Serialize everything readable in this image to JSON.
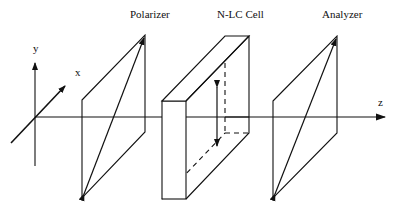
{
  "diagram": {
    "labels": {
      "polarizer": "Polarizer",
      "cell": "N-LC Cell",
      "analyzer": "Analyzer"
    },
    "axes": {
      "x": "x",
      "y": "y",
      "z": "z"
    },
    "colors": {
      "stroke": "#111111",
      "background": "#ffffff"
    }
  }
}
